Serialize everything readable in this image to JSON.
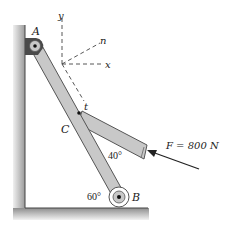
{
  "diagram": {
    "type": "statics-free-body-setup",
    "labels": {
      "pin_A": "A",
      "pin_B": "B",
      "point_C": "C",
      "axis_y": "y",
      "axis_x": "x",
      "axis_n": "n",
      "axis_t": "t",
      "force": "F = 800 N",
      "angle_bar_member": "40°",
      "angle_floor": "60°"
    },
    "colors": {
      "bar_fill": "#c8c8c8",
      "bar_stroke": "#555555",
      "bracket": "#4a4a4a",
      "wall": "#b0b0b0",
      "floor": "#a8a8a8",
      "line": "#333333"
    }
  }
}
